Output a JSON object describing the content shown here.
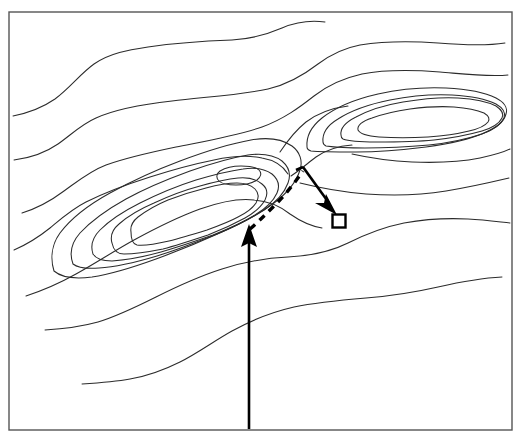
{
  "figure": {
    "background_color": "#ffffff",
    "width": 520,
    "height": 441
  },
  "frame": {
    "name": "map-border",
    "x": 9,
    "y": 12,
    "width": 503,
    "height": 418,
    "stroke_color": "#555555"
  },
  "style": {
    "contour_color": "#2b2b2b",
    "annotation_color": "#000000",
    "marker_fill": "#ffffff"
  },
  "chart_data": {
    "type": "contour-map",
    "xlabel": "",
    "ylabel": "",
    "grid": false,
    "legend": "none",
    "xlim": [
      9,
      512
    ],
    "ylim": [
      12,
      430
    ],
    "features": [
      {
        "name": "left-summit",
        "kind": "closed-contour-set",
        "ring_count": 6,
        "center": [
          240,
          175
        ],
        "description": "Elongated NE-SW ridge summit on the left half, six nested closed contours"
      },
      {
        "name": "right-summit",
        "kind": "closed-contour-set",
        "ring_count": 4,
        "center": [
          400,
          125
        ],
        "description": "Elongated E-W summit on the upper right, four nested closed contours"
      },
      {
        "name": "saddle",
        "kind": "col",
        "center": [
          300,
          150
        ],
        "description": "Low col between the two summits"
      },
      {
        "name": "lower-slope-contours",
        "kind": "open-contours",
        "count": 2,
        "description": "Two long open contour lines sweeping across the lower third of the map"
      },
      {
        "name": "upper-slope-contours",
        "kind": "open-contours",
        "count": 3,
        "description": "Open contour lines sweeping across the upper left of the map"
      }
    ],
    "annotations": [
      {
        "name": "approach-arrow",
        "type": "solid-arrow",
        "from": [
          249,
          428
        ],
        "to": [
          249,
          225
        ],
        "direction": "up",
        "description": "Vertical solid arrow pointing up to the southern flank of the left summit"
      },
      {
        "name": "route-path",
        "type": "dashed-path",
        "from": [
          250,
          228
        ],
        "to": [
          303,
          170
        ],
        "description": "Dashed traverse from the arrow tip up along the ridge to the saddle"
      },
      {
        "name": "descent-arrow",
        "type": "solid-arrow",
        "from": [
          303,
          168
        ],
        "to": [
          336,
          214
        ],
        "direction": "down-right",
        "description": "Solid arrow from the saddle down-right to the square marker"
      },
      {
        "name": "target-marker",
        "type": "open-square",
        "position": [
          339,
          221
        ],
        "size": 13,
        "description": "Small open square marking the target location"
      }
    ]
  }
}
